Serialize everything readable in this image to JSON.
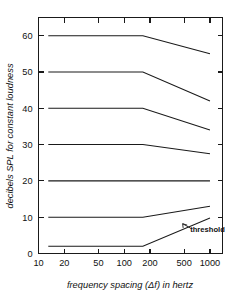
{
  "chart_data": {
    "type": "line",
    "title": "",
    "xlabel": "frequency spacing (Δf) in hertz",
    "ylabel": "decibels SPL for constant loudness",
    "xscale": "log",
    "xlim": [
      10,
      1400
    ],
    "ylim": [
      0,
      65
    ],
    "xticks": [
      10,
      20,
      50,
      100,
      200,
      500,
      1000
    ],
    "xtick_labels": [
      "10",
      "20",
      "50",
      "100",
      "200",
      "500",
      "1000"
    ],
    "yticks": [
      0,
      10,
      20,
      30,
      40,
      50,
      60
    ],
    "ytick_labels": [
      "0",
      "10",
      "20",
      "30",
      "40",
      "50",
      "60"
    ],
    "grid": false,
    "legend": null,
    "annotations": [
      {
        "text": "threshold",
        "x": 620,
        "y": 6.0,
        "points_to_x": 480,
        "points_to_y": 8.2
      }
    ],
    "series": [
      {
        "name": "60 dB",
        "x": [
          13,
          165,
          1000
        ],
        "values": [
          60,
          60,
          55
        ]
      },
      {
        "name": "50 dB",
        "x": [
          13,
          165,
          1000
        ],
        "values": [
          50,
          50,
          42
        ]
      },
      {
        "name": "40 dB",
        "x": [
          13,
          165,
          1000
        ],
        "values": [
          40,
          40,
          34
        ]
      },
      {
        "name": "30 dB",
        "x": [
          13,
          165,
          1000
        ],
        "values": [
          30,
          30,
          27.5
        ]
      },
      {
        "name": "20 dB",
        "x": [
          13,
          165,
          1000
        ],
        "values": [
          20,
          20,
          20
        ]
      },
      {
        "name": "10 dB",
        "x": [
          13,
          165,
          1000
        ],
        "values": [
          10,
          10,
          13
        ]
      },
      {
        "name": "threshold",
        "x": [
          13,
          165,
          1000
        ],
        "values": [
          2,
          2,
          9.8
        ]
      }
    ]
  }
}
